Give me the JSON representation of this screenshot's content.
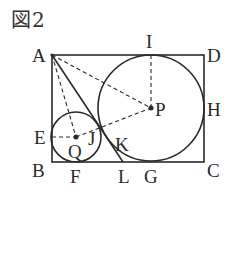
{
  "figure": {
    "title": "図2"
  },
  "points": {
    "A": {
      "label": "A",
      "x": 52,
      "y": 55
    },
    "B": {
      "label": "B",
      "x": 52,
      "y": 162
    },
    "C": {
      "label": "C",
      "x": 204,
      "y": 162
    },
    "D": {
      "label": "D",
      "x": 204,
      "y": 55
    },
    "E": {
      "label": "E",
      "x": 52,
      "y": 137
    },
    "F": {
      "label": "F",
      "x": 76,
      "y": 162
    },
    "G": {
      "label": "G",
      "x": 151,
      "y": 162
    },
    "H": {
      "label": "H",
      "x": 204,
      "y": 108
    },
    "I": {
      "label": "I",
      "x": 151,
      "y": 55
    },
    "J": {
      "label": "J",
      "x": 97,
      "y": 124
    },
    "K": {
      "label": "K",
      "x": 112,
      "y": 135
    },
    "L": {
      "label": "L",
      "x": 123,
      "y": 162
    },
    "P": {
      "label": "P",
      "x": 151,
      "y": 108
    },
    "Q": {
      "label": "Q",
      "x": 76,
      "y": 137
    }
  },
  "circles": {
    "large": {
      "center": "P",
      "radius": 53
    },
    "small": {
      "center": "Q",
      "radius": 25
    }
  },
  "colors": {
    "stroke": "#2a2a2a",
    "background": "#ffffff"
  }
}
